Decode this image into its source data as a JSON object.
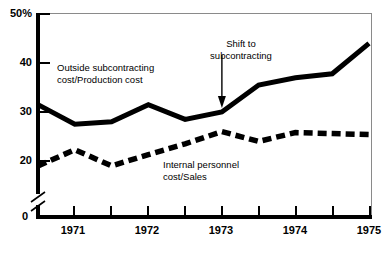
{
  "chart_data": {
    "type": "line",
    "title": "",
    "subtitle": "",
    "xlabel": "",
    "ylabel": "",
    "grid": false,
    "legend_position": "inline-annotations",
    "axis_break": true,
    "ylim": [
      0,
      50
    ],
    "y_ticks": [
      {
        "value": 50,
        "label": "50%"
      },
      {
        "value": 40,
        "label": "40"
      },
      {
        "value": 30,
        "label": "30"
      },
      {
        "value": 20,
        "label": "20"
      },
      {
        "value": 0,
        "label": "0"
      }
    ],
    "x_ticks": [
      {
        "value": 1971.0,
        "label": "1971"
      },
      {
        "value": 1971.5,
        "label": ""
      },
      {
        "value": 1972.0,
        "label": "1972"
      },
      {
        "value": 1972.5,
        "label": ""
      },
      {
        "value": 1973.0,
        "label": "1973"
      },
      {
        "value": 1973.5,
        "label": ""
      },
      {
        "value": 1974.0,
        "label": "1974"
      },
      {
        "value": 1974.5,
        "label": ""
      },
      {
        "value": 1975.0,
        "label": "1975"
      }
    ],
    "xlim": [
      1970.5,
      1975.0
    ],
    "x": [
      1970.5,
      1971.0,
      1971.5,
      1972.0,
      1972.5,
      1973.0,
      1973.5,
      1974.0,
      1974.5,
      1975.0
    ],
    "series": [
      {
        "name": "Outside subcontracting cost/Production cost",
        "style": "solid",
        "color": "#000000",
        "values": [
          31.5,
          27.5,
          28.0,
          31.5,
          28.5,
          30.0,
          35.5,
          37.0,
          37.8,
          44.0
        ]
      },
      {
        "name": "Internal personnel cost/Sales",
        "style": "dashed",
        "color": "#000000",
        "values": [
          19.0,
          22.3,
          19.0,
          21.3,
          23.5,
          26.0,
          24.0,
          25.8,
          25.6,
          25.4
        ]
      }
    ],
    "annotations": [
      {
        "id": "outside",
        "text": "Outside subcontracting cost/Production cost"
      },
      {
        "id": "internal",
        "text": "Internal personnel cost/Sales"
      },
      {
        "id": "shift",
        "text": "Shift to subcontracting",
        "arrow": true,
        "points_to_x": 1973.0,
        "points_to_y": 30.0
      }
    ]
  },
  "labels": {
    "y": {
      "t50": "50%",
      "t40": "40",
      "t30": "30",
      "t20": "20",
      "t0": "0"
    },
    "x": {
      "y1971": "1971",
      "y1972": "1972",
      "y1973": "1973",
      "y1974": "1974",
      "y1975": "1975"
    },
    "annotations": {
      "outside_line1": "Outside subcontracting",
      "outside_line2": "cost/Production cost",
      "internal_line1": "Internal personnel",
      "internal_line2": "cost/Sales",
      "shift_line1": "Shift to",
      "shift_line2": "subcontracting"
    }
  },
  "colors": {
    "ink": "#000000",
    "frame": "#8a8a8a",
    "background": "#ffffff"
  }
}
